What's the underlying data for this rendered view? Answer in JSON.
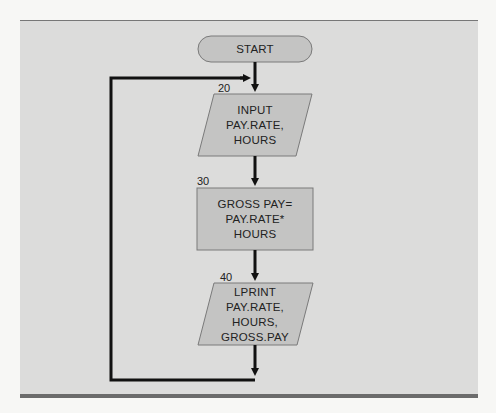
{
  "flowchart": {
    "start": {
      "label": "START"
    },
    "steps": [
      {
        "line": "20",
        "type": "input-output",
        "lines": [
          "INPUT",
          "PAY.RATE,",
          "HOURS"
        ]
      },
      {
        "line": "30",
        "type": "process",
        "lines": [
          "GROSS PAY=",
          "PAY.RATE*",
          "HOURS"
        ]
      },
      {
        "line": "40",
        "type": "input-output",
        "lines": [
          "LPRINT",
          "PAY.RATE,",
          "HOURS,",
          "GROSS.PAY"
        ]
      }
    ],
    "loop": {
      "from": "step-40",
      "to": "step-20"
    }
  },
  "colors": {
    "panel": "#dcdcdb",
    "shape_fill": "#c4c4c3",
    "shape_stroke": "#808080",
    "arrow": "#111111",
    "rule": "#6b6b6b"
  }
}
